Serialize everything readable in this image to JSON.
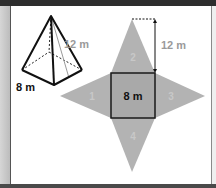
{
  "figure": {
    "pyramid": {
      "base_edge_label": "8 m",
      "slant_height_label": "12 m"
    },
    "net": {
      "square_label": "8 m",
      "height_label": "12 m",
      "faces": [
        {
          "id": 1,
          "label": "1",
          "position": "left"
        },
        {
          "id": 2,
          "label": "2",
          "position": "top"
        },
        {
          "id": 3,
          "label": "3",
          "position": "right"
        },
        {
          "id": 4,
          "label": "4",
          "position": "bottom"
        }
      ]
    },
    "colors": {
      "face_fill": "#b3b3b3",
      "square_fill": "#a9a9a9",
      "edge": "#1a1a1a",
      "label_grey": "#9a9a9a",
      "face_number": "#c8c8c8"
    }
  }
}
